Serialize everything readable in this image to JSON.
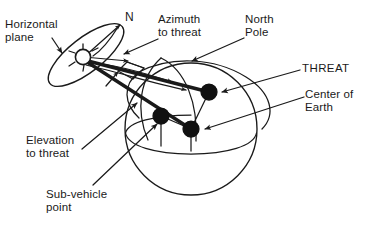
{
  "figure": {
    "type": "technical-diagram",
    "background_color": "#ffffff",
    "stroke_color": "#1a1a1a",
    "fill_color": "#111111"
  },
  "labels": {
    "horizontal_plane": "Horizontal\nplane",
    "north_mark": "N",
    "azimuth_to_threat": "Azimuth\nto threat",
    "north_pole": "North\nPole",
    "threat": "THREAT",
    "center_of_earth": "Center of\nEarth",
    "elevation_to_threat": "Elevation\nto threat",
    "sub_vehicle_point": "Sub-vehicle\npoint"
  },
  "elements": {
    "satellite": "satellite-vehicle-marker",
    "earth_sphere": "earth-sphere",
    "equator": "equator-line",
    "meridian": "meridian-arc",
    "horizon_plane": "horizontal-plane-ellipse",
    "azimuth_arc": "azimuth-angle-arc",
    "elevation_wedge": "elevation-angle-wedge",
    "line_of_sight": "line-of-sight-to-threat",
    "threat_dot": "threat-point",
    "sub_vehicle_dot": "sub-vehicle-point",
    "earth_center_dot": "earth-center-point"
  },
  "points": {
    "satellite": [
      83,
      57
    ],
    "threat": [
      209,
      92
    ],
    "sub_vehicle": [
      161,
      116
    ],
    "earth_center": [
      191,
      129
    ],
    "north_direction": [
      122,
      22
    ],
    "north_pole_on_sphere": [
      188,
      62
    ]
  },
  "geometry": {
    "sphere_center": [
      191,
      129
    ],
    "sphere_radius": 66,
    "plane_center": [
      86,
      55
    ],
    "plane_rx": 46,
    "plane_ry": 17,
    "plane_rotation_deg": -38
  }
}
